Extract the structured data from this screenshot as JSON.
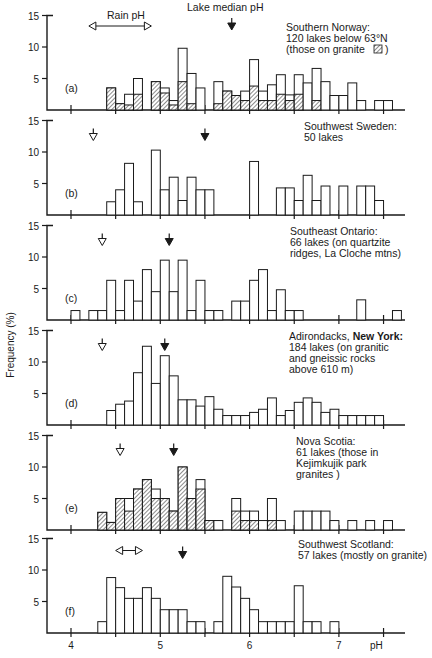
{
  "chart_data": {
    "type": "bar",
    "title": "",
    "xlabel": "pH",
    "ylabel": "Frequency (%)",
    "x_ticks": [
      "4",
      "5",
      "6",
      "7"
    ],
    "y_ticks": [
      "5",
      "10",
      "15"
    ],
    "ylim": [
      0,
      15
    ],
    "xlim": [
      3.8,
      7.9
    ],
    "bin_width": 0.1,
    "legend": {
      "hatched": "granite / Kejimkujik park granites",
      "open": "all lakes"
    },
    "annotations": {
      "rain_ph": "Rain pH",
      "lake_median_ph": "Lake median pH"
    },
    "panels": [
      {
        "id": "a",
        "label": "(a)",
        "title_lines": [
          "Southern Norway:",
          "120 lakes below 63°N",
          "(those on granite"
        ],
        "rain_ph_range": [
          4.2,
          4.9
        ],
        "lake_median_ph": 5.8,
        "bins_start": [
          4.4,
          4.5,
          4.6,
          4.7,
          4.9,
          5.0,
          5.1,
          5.2,
          5.3,
          5.4,
          5.6,
          5.7,
          5.8,
          5.9,
          6.0,
          6.1,
          6.2,
          6.3,
          6.4,
          6.5,
          6.6,
          6.7,
          6.8,
          6.9,
          7.0,
          7.1,
          7.2,
          7.4,
          7.5
        ],
        "totals": [
          3.5,
          1.0,
          2.5,
          5.0,
          4.5,
          3.5,
          1.5,
          9.8,
          5.8,
          3.5,
          4.5,
          3.0,
          2.3,
          3.0,
          8.0,
          3.0,
          4.0,
          5.6,
          2.4,
          5.6,
          4.3,
          6.6,
          4.5,
          2.3,
          2.3,
          4.3,
          1.5,
          1.5,
          1.5
        ],
        "granite": [
          3.5,
          1.0,
          0.8,
          2.5,
          4.5,
          2.7,
          0.8,
          4.5,
          1.0,
          0,
          1.0,
          3.0,
          2.3,
          1.5,
          3.8,
          1.5,
          1.5,
          2.5,
          1.5,
          2.5,
          0,
          1.5,
          0,
          0,
          0,
          0,
          0,
          0,
          0
        ]
      },
      {
        "id": "b",
        "label": "(b)",
        "title_lines": [
          "Southwest Sweden:",
          "50 lakes"
        ],
        "rain_ph_marker": 4.25,
        "lake_median_ph": 5.5,
        "bins_start": [
          4.4,
          4.5,
          4.6,
          4.7,
          4.9,
          5.0,
          5.1,
          5.2,
          5.3,
          5.4,
          5.5,
          6.0,
          6.3,
          6.4,
          6.5,
          6.6,
          6.7,
          6.8,
          7.0,
          7.2,
          7.3,
          7.4
        ],
        "totals": [
          2.1,
          4.0,
          8.2,
          2.1,
          10.3,
          4.0,
          6.0,
          2.3,
          6.0,
          4.0,
          4.0,
          8.5,
          4.3,
          4.3,
          2.3,
          6.3,
          2.3,
          4.6,
          4.6,
          4.6,
          4.6,
          2.3
        ]
      },
      {
        "id": "c",
        "label": "(c)",
        "title_lines": [
          "Southeast Ontario:",
          "66 lakes (on quartzite",
          "ridges, La Cloche mtns)"
        ],
        "rain_ph_marker": 4.35,
        "lake_median_ph": 5.1,
        "bins_start": [
          4.0,
          4.2,
          4.3,
          4.4,
          4.5,
          4.6,
          4.7,
          4.8,
          4.9,
          5.0,
          5.1,
          5.2,
          5.3,
          5.4,
          5.5,
          5.6,
          5.8,
          5.9,
          6.0,
          6.1,
          6.2,
          6.3,
          6.4,
          6.5,
          7.2,
          7.6
        ],
        "totals": [
          1.5,
          1.5,
          1.5,
          6.3,
          1.5,
          6.3,
          3.0,
          8.0,
          4.5,
          9.5,
          4.5,
          9.5,
          1.5,
          6.3,
          1.5,
          1.5,
          3.0,
          3.0,
          6.3,
          8.0,
          1.5,
          4.8,
          1.5,
          1.5,
          3.2,
          1.5
        ]
      },
      {
        "id": "d",
        "label": "(d)",
        "title_lines": [
          "Adirondacks, New York:",
          "184 lakes (on granitic",
          "and gneissic rocks",
          "above 610 m)"
        ],
        "rain_ph_marker": 4.35,
        "lake_median_ph": 5.05,
        "bins_start": [
          4.4,
          4.5,
          4.6,
          4.7,
          4.8,
          4.9,
          5.0,
          5.1,
          5.2,
          5.3,
          5.4,
          5.5,
          5.6,
          5.7,
          5.8,
          5.9,
          6.0,
          6.1,
          6.2,
          6.3,
          6.4,
          6.5,
          6.6,
          6.7,
          6.8,
          6.9,
          7.0,
          7.1,
          7.2,
          7.3,
          7.4
        ],
        "totals": [
          2.3,
          3.3,
          3.8,
          8.3,
          12.5,
          6.6,
          11.0,
          7.8,
          4.0,
          4.0,
          3.0,
          4.5,
          2.5,
          1.5,
          1.5,
          1.5,
          2.0,
          2.5,
          4.3,
          1.5,
          2.3,
          3.6,
          4.3,
          3.6,
          2.0,
          2.5,
          1.5,
          1.5,
          1.5,
          1.5,
          1.5
        ]
      },
      {
        "id": "e",
        "label": "(e)",
        "title_lines": [
          "Nova Scotia:",
          "61 lakes (those in",
          "Kejimkujik park",
          "granites )"
        ],
        "rain_ph_marker": 4.55,
        "lake_median_ph": 5.15,
        "bins_start": [
          4.3,
          4.4,
          4.5,
          4.6,
          4.7,
          4.8,
          4.9,
          5.0,
          5.1,
          5.2,
          5.3,
          5.4,
          5.5,
          5.6,
          5.8,
          5.9,
          6.0,
          6.1,
          6.2,
          6.3,
          6.5,
          6.6,
          6.7,
          6.8,
          6.9,
          7.1,
          7.3,
          7.5
        ],
        "totals": [
          2.8,
          1.2,
          5.0,
          5.0,
          6.5,
          8.0,
          6.5,
          5.0,
          3.0,
          10.0,
          5.0,
          8.0,
          1.5,
          1.5,
          5.0,
          3.0,
          3.0,
          1.5,
          5.0,
          1.5,
          3.0,
          3.0,
          3.0,
          3.0,
          1.5,
          1.5,
          1.5,
          1.5
        ],
        "granite": [
          2.8,
          1.2,
          5.0,
          3.0,
          6.5,
          8.0,
          5.0,
          5.0,
          3.0,
          10.0,
          5.0,
          6.5,
          1.5,
          0,
          3.0,
          1.5,
          1.5,
          0,
          1.5,
          0,
          0,
          0,
          0,
          0,
          0,
          0,
          0,
          0
        ]
      },
      {
        "id": "f",
        "label": "(f)",
        "title_lines": [
          "Southwest Scotland:",
          "57 lakes (mostly on granite)"
        ],
        "rain_ph_range": [
          4.5,
          4.8
        ],
        "lake_median_ph": 5.25,
        "bins_start": [
          4.3,
          4.4,
          4.5,
          4.6,
          4.7,
          4.8,
          4.9,
          5.0,
          5.1,
          5.2,
          5.3,
          5.4,
          5.6,
          5.7,
          5.8,
          5.9,
          6.0,
          6.1,
          6.2,
          6.3,
          6.4,
          6.5,
          6.6,
          6.7,
          6.9
        ],
        "totals": [
          1.8,
          8.8,
          7.2,
          5.5,
          5.5,
          7.2,
          5.5,
          3.7,
          3.7,
          3.7,
          1.8,
          1.8,
          1.8,
          9.0,
          7.3,
          5.5,
          3.7,
          1.8,
          1.8,
          1.8,
          1.8,
          7.5,
          1.8,
          1.8,
          1.8
        ]
      }
    ]
  }
}
